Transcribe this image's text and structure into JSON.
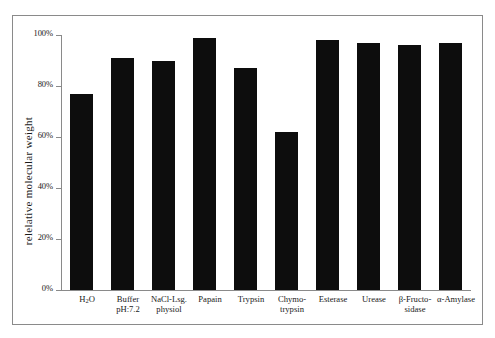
{
  "chart_data": {
    "type": "bar",
    "title": "",
    "xlabel": "",
    "ylabel": "relelative  molecular weight",
    "ylim": [
      0,
      100
    ],
    "yunit": "%",
    "grid": false,
    "legend": false,
    "categories": [
      "H₂O",
      "Buffer pH:7.2",
      "NaCl-Lsg. physiol",
      "Papain",
      "Trypsin",
      "Chymo-trypsin",
      "Esterase",
      "Urease",
      "β-Fructo-sidase",
      "α-Amylase"
    ],
    "values": [
      77,
      91,
      90,
      99,
      87,
      62,
      98,
      97,
      96,
      97
    ],
    "yticks": [
      "0%",
      "20%",
      "40%",
      "60%",
      "80%",
      "100%"
    ],
    "ytick_values": [
      0,
      20,
      40,
      60,
      80,
      100
    ],
    "bar_color": "#0d0d0d",
    "axis_color": "#8a8a8a",
    "frame_color": "#8a8a8a",
    "background": "#ffffff"
  },
  "axis": {
    "y_title": "relelative  molecular weight",
    "ticks": [
      {
        "label": "100%",
        "value": 100
      },
      {
        "label": "80%",
        "value": 80
      },
      {
        "label": "60%",
        "value": 60
      },
      {
        "label": "40%",
        "value": 40
      },
      {
        "label": "20%",
        "value": 20
      },
      {
        "label": "0%",
        "value": 0
      }
    ]
  },
  "bars": [
    {
      "line1": "H",
      "sub": "2",
      "line1b": "O",
      "line2": "",
      "value": 77,
      "name": "h2o"
    },
    {
      "line1": "Buffer",
      "line2": "pH:7.2",
      "value": 91,
      "name": "buffer-ph72"
    },
    {
      "line1": "NaCl-Lsg.",
      "line2": "physiol",
      "value": 90,
      "name": "nacl-lsg-physiol"
    },
    {
      "line1": "Papain",
      "line2": "",
      "value": 99,
      "name": "papain"
    },
    {
      "line1": "Trypsin",
      "line2": "",
      "value": 87,
      "name": "trypsin"
    },
    {
      "line1": "Chymo-",
      "line2": "trypsin",
      "value": 62,
      "name": "chymotrypsin"
    },
    {
      "line1": "Esterase",
      "line2": "",
      "value": 98,
      "name": "esterase"
    },
    {
      "line1": "Urease",
      "line2": "",
      "value": 97,
      "name": "urease"
    },
    {
      "line1": "β-Fructo-",
      "line2": "sidase",
      "value": 96,
      "name": "beta-fructosidase"
    },
    {
      "line1": "α-Amylase",
      "line2": "",
      "value": 97,
      "name": "alpha-amylase"
    }
  ]
}
